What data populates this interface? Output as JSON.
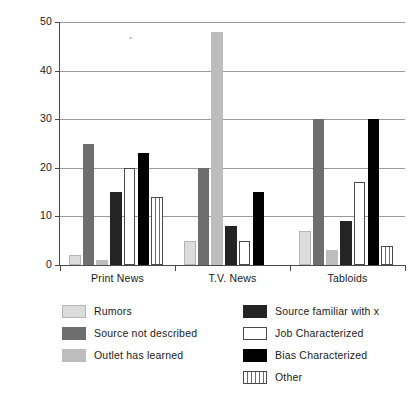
{
  "chart_data": {
    "type": "bar",
    "title": "",
    "xlabel": "",
    "ylabel": "Percent",
    "ylim": [
      0,
      50
    ],
    "yticks": [
      0,
      10,
      20,
      30,
      40,
      50
    ],
    "grid": true,
    "legend_position": "bottom",
    "categories": [
      "Print News",
      "T.V. News",
      "Tabloids"
    ],
    "series": [
      {
        "name": "Rumors",
        "color": "#dcdcdc",
        "values": [
          2,
          5,
          7
        ]
      },
      {
        "name": "Source not described",
        "color": "#6e6e6e",
        "values": [
          25,
          20,
          30
        ]
      },
      {
        "name": "Outlet has learned",
        "color": "#bdbdbd",
        "values": [
          1,
          48,
          3
        ]
      },
      {
        "name": "Source familiar with x",
        "color": "#242424",
        "values": [
          15,
          8,
          9
        ]
      },
      {
        "name": "Job Characterized",
        "color": "#ffffff",
        "values": [
          20,
          5,
          17
        ]
      },
      {
        "name": "Bias Characterized",
        "color": "#000000",
        "values": [
          23,
          15,
          30
        ]
      },
      {
        "name": "Other",
        "color": "striped",
        "values": [
          14,
          0,
          4
        ]
      }
    ]
  },
  "axis": {
    "ylabel": "Percent",
    "ytick_labels": [
      "50",
      "40",
      "30",
      "20",
      "10",
      "0"
    ],
    "xtick_labels": [
      "Print News",
      "T.V. News",
      "Tabloids"
    ]
  },
  "legend": {
    "left_column": [
      {
        "label": "Rumors",
        "swatch": "light-gray-swatch"
      },
      {
        "label": "Source not described",
        "swatch": "dark-gray-swatch"
      },
      {
        "label": "Outlet has learned",
        "swatch": "medium-gray-swatch"
      }
    ],
    "right_column": [
      {
        "label": "Source familiar with x",
        "swatch": "near-black-swatch"
      },
      {
        "label": "Job Characterized",
        "swatch": "white-swatch"
      },
      {
        "label": "Bias Characterized",
        "swatch": "black-swatch"
      },
      {
        "label": "Other",
        "swatch": "striped-swatch"
      }
    ]
  }
}
